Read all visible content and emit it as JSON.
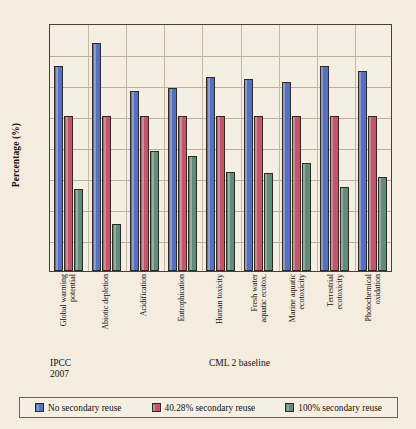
{
  "chart_data": {
    "type": "bar",
    "title": "",
    "xlabel": "",
    "ylabel": "Percentage (%)",
    "ylim": [
      0,
      160
    ],
    "yticks": [
      0,
      20,
      40,
      60,
      80,
      100,
      120,
      140,
      160
    ],
    "grid": true,
    "legend_position": "bottom",
    "categories": [
      "Global warming\npotential",
      "Abiotic depletion",
      "Acidification",
      "Eutrophication",
      "Human toxicity",
      "Fresh water\naquatic ecotox.",
      "Marine aquatic\necotoxicity",
      "Terrestrial\necotoxicity",
      "Photochemical\noxidation"
    ],
    "series": [
      {
        "name": "No secondary reuse",
        "color": "#5570bf",
        "values": [
          132,
          147,
          116,
          118,
          125,
          124,
          122,
          132,
          129
        ]
      },
      {
        "name": "40.28% secondary reuse",
        "color": "#c3566c",
        "values": [
          100,
          100,
          100,
          100,
          100,
          100,
          100,
          100,
          100
        ]
      },
      {
        "name": "100% secondary reuse",
        "color": "#5f8d79",
        "values": [
          53,
          30.5,
          77.5,
          74.5,
          64,
          63,
          70,
          54.5,
          60.5
        ]
      }
    ],
    "annotations": [
      {
        "name": "ipcc",
        "text": "IPCC\n2007"
      },
      {
        "name": "cml",
        "text": "CML 2 baseline"
      }
    ]
  }
}
